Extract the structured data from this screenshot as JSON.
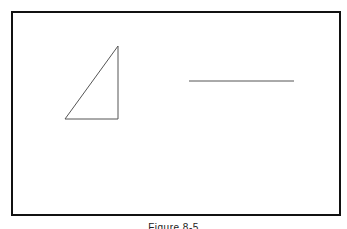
{
  "figure": {
    "caption": "Figure 8-5",
    "shapes": [
      {
        "type": "right-triangle",
        "points": [
          [
            65,
            119
          ],
          [
            118,
            46
          ],
          [
            118,
            119
          ]
        ]
      },
      {
        "type": "line-segment",
        "from": [
          189,
          81
        ],
        "to": [
          294,
          81
        ]
      }
    ],
    "stroke_color": "#555555",
    "frame_color": "#111111"
  }
}
